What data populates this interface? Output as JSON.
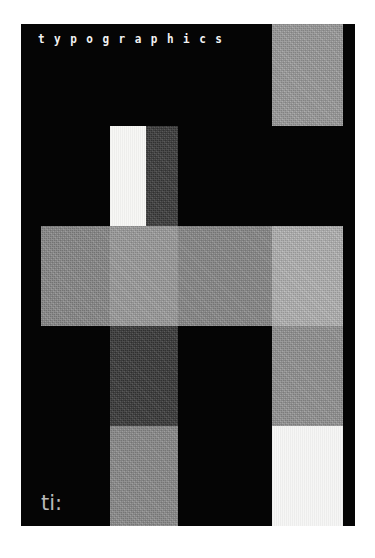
{
  "canvas": {
    "width": 375,
    "height": 558,
    "background": "#ffffff"
  },
  "poster": {
    "x": 21,
    "y": 24,
    "width": 334,
    "height": 502,
    "background": "#050505",
    "title": "typographics",
    "mark": "ti:"
  },
  "palette": {
    "paper": "#ffffff",
    "ink": "#050505",
    "gray_dark": "#3a3a3a",
    "gray_mid": "#8a8a8a",
    "gray_light": "#9a9a9a",
    "gray_pale": "#b4b4b4",
    "near_white": "#f2f2f2",
    "white": "#fafafa",
    "mark_gray": "#b9b9b9"
  },
  "blocks": [
    {
      "name": "block-top-right",
      "x": 251,
      "y": 0,
      "w": 71,
      "h": 102,
      "color": "#9c9c9c",
      "texture": "grain"
    },
    {
      "name": "block-white-column",
      "x": 89,
      "y": 102,
      "w": 36,
      "h": 100,
      "color": "#f7f7f5",
      "texture": "smooth"
    },
    {
      "name": "block-dark-column-upper",
      "x": 125,
      "y": 102,
      "w": 32,
      "h": 100,
      "color": "#3a3a3a",
      "texture": "grain"
    },
    {
      "name": "block-band-left",
      "x": 20,
      "y": 202,
      "w": 69,
      "h": 100,
      "color": "#8a8a8a",
      "texture": "grain"
    },
    {
      "name": "block-band-center",
      "x": 89,
      "y": 202,
      "w": 68,
      "h": 100,
      "color": "#9e9e9e",
      "texture": "grain"
    },
    {
      "name": "block-band-right",
      "x": 157,
      "y": 202,
      "w": 100,
      "h": 100,
      "color": "#8a8a8a",
      "texture": "grain"
    },
    {
      "name": "block-right-light",
      "x": 251,
      "y": 202,
      "w": 71,
      "h": 100,
      "color": "#b4b4b4",
      "texture": "grain"
    },
    {
      "name": "block-dark-column-lower",
      "x": 89,
      "y": 302,
      "w": 68,
      "h": 100,
      "color": "#383838",
      "texture": "grain"
    },
    {
      "name": "block-right-mid",
      "x": 251,
      "y": 302,
      "w": 71,
      "h": 100,
      "color": "#949494",
      "texture": "grain"
    },
    {
      "name": "block-center-bottom",
      "x": 89,
      "y": 402,
      "w": 68,
      "h": 100,
      "color": "#8c8c8c",
      "texture": "grain"
    },
    {
      "name": "block-right-white",
      "x": 251,
      "y": 402,
      "w": 71,
      "h": 100,
      "color": "#f6f6f5",
      "texture": "smooth"
    }
  ]
}
